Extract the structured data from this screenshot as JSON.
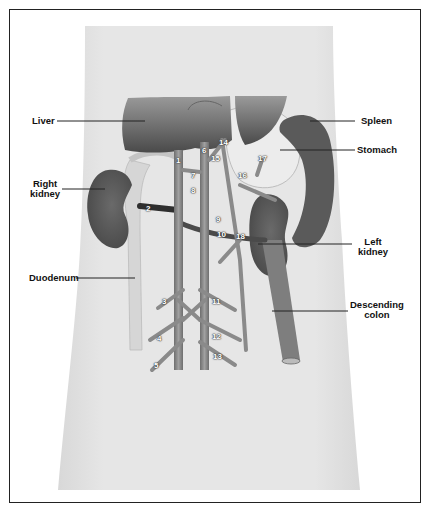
{
  "diagram": {
    "type": "anatomical-illustration",
    "labels": {
      "liver": "Liver",
      "spleen": "Spleen",
      "stomach": "Stomach",
      "right_kidney_line1": "Right",
      "right_kidney_line2": "kidney",
      "left_kidney_line1": "Left",
      "left_kidney_line2": "kidney",
      "duodenum": "Duodenum",
      "descending_colon_line1": "Descending",
      "descending_colon_line2": "colon"
    },
    "numbers": [
      "1",
      "2",
      "3",
      "4",
      "5",
      "6",
      "7",
      "8",
      "9",
      "10",
      "11",
      "12",
      "13",
      "14",
      "15",
      "16",
      "17",
      "18"
    ],
    "colors": {
      "frame": "#222222",
      "body": "#e4e4e4",
      "organ_dark": "#555555",
      "vessel": "#8a8a8a",
      "leader_line": "#222222"
    }
  }
}
